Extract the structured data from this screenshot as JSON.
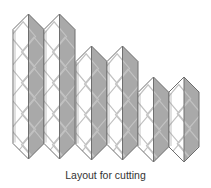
{
  "caption": "Layout for cutting",
  "colors": {
    "background": "#ffffff",
    "light_face": "#ffffff",
    "dark_face": "#a9a9a9",
    "outline": "#6e6e6e",
    "diamond": "#c2c2c2"
  },
  "columns": [
    {
      "name": "column-1",
      "left": 13,
      "mid": 28.5,
      "right": 44,
      "top": 14,
      "bottom": 159
    },
    {
      "name": "column-2",
      "left": 44,
      "mid": 59.5,
      "right": 75,
      "top": 14,
      "bottom": 159
    },
    {
      "name": "column-3",
      "left": 76,
      "mid": 91.5,
      "right": 107,
      "top": 46,
      "bottom": 160
    },
    {
      "name": "column-4",
      "left": 107,
      "mid": 122.5,
      "right": 138,
      "top": 46,
      "bottom": 160
    },
    {
      "name": "column-5",
      "left": 138,
      "mid": 153.5,
      "right": 169,
      "top": 77,
      "bottom": 162
    },
    {
      "name": "column-6",
      "left": 169,
      "mid": 184,
      "right": 199,
      "top": 77,
      "bottom": 162
    }
  ]
}
